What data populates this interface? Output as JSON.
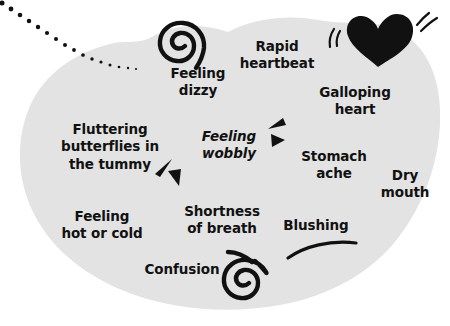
{
  "image": {
    "kind": "illustration",
    "title": "Anxiety body symptoms blob diagram",
    "width": 450,
    "height": 326
  },
  "colors": {
    "background": "#ffffff",
    "blob_fill": "#e3e3e3",
    "ink": "#111111",
    "heart_fill": "#111111"
  },
  "blob": {
    "name": "body-outline-blob",
    "fill": "#e3e3e3"
  },
  "labels": [
    {
      "id": "feeling-dizzy",
      "text": "Feeling\ndizzy",
      "x": 198,
      "y": 82,
      "style": "upright",
      "size": "normal"
    },
    {
      "id": "rapid-heartbeat",
      "text": "Rapid\nheartbeat",
      "x": 277,
      "y": 55,
      "style": "upright",
      "size": "normal"
    },
    {
      "id": "galloping-heart",
      "text": "Galloping\nheart",
      "x": 355,
      "y": 101,
      "style": "upright",
      "size": "normal"
    },
    {
      "id": "fluttering-butterflies",
      "text": "Fluttering\nbutterflies in\nthe tummy",
      "x": 110,
      "y": 147,
      "style": "upright",
      "size": "normal"
    },
    {
      "id": "feeling-wobbly",
      "text": "Feeling\nwobbly",
      "x": 229,
      "y": 145,
      "style": "italic",
      "size": "normal"
    },
    {
      "id": "stomach-ache",
      "text": "Stomach\nache",
      "x": 334,
      "y": 165,
      "style": "upright",
      "size": "normal"
    },
    {
      "id": "dry-mouth",
      "text": "Dry\nmouth",
      "x": 405,
      "y": 184,
      "style": "upright",
      "size": "normal"
    },
    {
      "id": "feeling-hot-or-cold",
      "text": "Feeling\nhot or cold",
      "x": 102,
      "y": 225,
      "style": "upright",
      "size": "normal"
    },
    {
      "id": "shortness-of-breath",
      "text": "Shortness\nof breath",
      "x": 222,
      "y": 220,
      "style": "upright",
      "size": "normal"
    },
    {
      "id": "blushing",
      "text": "Blushing",
      "x": 316,
      "y": 226,
      "style": "upright",
      "size": "normal"
    },
    {
      "id": "confusion",
      "text": "Confusion",
      "x": 182,
      "y": 270,
      "style": "upright",
      "size": "normal"
    }
  ],
  "icons": [
    {
      "id": "spiral-top",
      "name": "spiral-dizzy-icon",
      "x": 183,
      "y": 42
    },
    {
      "id": "spiral-bottom",
      "name": "spiral-confusion-icon",
      "x": 247,
      "y": 279
    },
    {
      "id": "heart",
      "name": "heart-icon",
      "x": 378,
      "y": 38
    },
    {
      "id": "triangles-left",
      "name": "flutter-triangles-icon",
      "x": 165,
      "y": 172
    },
    {
      "id": "triangles-right",
      "name": "wobble-triangles-icon",
      "x": 277,
      "y": 130
    },
    {
      "id": "blush-arc",
      "name": "blush-curve-icon",
      "x": 327,
      "y": 248
    },
    {
      "id": "dotted-trail",
      "name": "dotted-trail-icon",
      "x": 70,
      "y": 35
    }
  ]
}
